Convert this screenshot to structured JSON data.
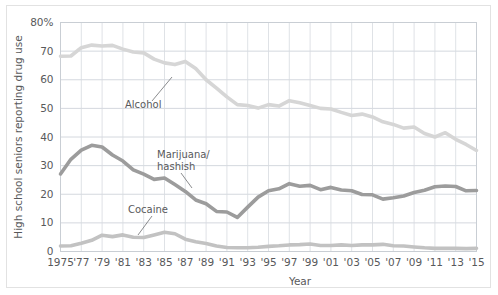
{
  "chart_data": {
    "type": "line",
    "title": "",
    "xlabel": "Year",
    "ylabel": "High school seniors reporting drug use",
    "ylim": [
      0,
      80
    ],
    "yticks": [
      0,
      10,
      20,
      30,
      40,
      50,
      60,
      70,
      80
    ],
    "ytick_labels": [
      "0",
      "10",
      "20",
      "30",
      "40",
      "50",
      "60",
      "70",
      "80%"
    ],
    "xlim": [
      1975,
      2015
    ],
    "xticks": [
      1975,
      1977,
      1979,
      1981,
      1983,
      1985,
      1987,
      1989,
      1991,
      1993,
      1995,
      1997,
      1999,
      2001,
      2003,
      2005,
      2007,
      2009,
      2011,
      2013,
      2015
    ],
    "xtick_labels": [
      "1975",
      "'77",
      "'79",
      "'81",
      "'83",
      "'85",
      "'87",
      "'89",
      "'91",
      "'93",
      "'95",
      "'97",
      "'99",
      "'01",
      "'03",
      "'05",
      "'07",
      "'09",
      "'11",
      "'13",
      "'15"
    ],
    "grid": true,
    "legend": "inline-annotations",
    "x": [
      1975,
      1976,
      1977,
      1978,
      1979,
      1980,
      1981,
      1982,
      1983,
      1984,
      1985,
      1986,
      1987,
      1988,
      1989,
      1990,
      1991,
      1992,
      1993,
      1994,
      1995,
      1996,
      1997,
      1998,
      1999,
      2000,
      2001,
      2002,
      2003,
      2004,
      2005,
      2006,
      2007,
      2008,
      2009,
      2010,
      2011,
      2012,
      2013,
      2014,
      2015
    ],
    "series": [
      {
        "name": "Alcohol",
        "color": "#d6d6d6",
        "values": [
          68.2,
          68.3,
          71.2,
          72.1,
          71.8,
          72.0,
          70.7,
          69.7,
          69.4,
          67.2,
          65.9,
          65.3,
          66.4,
          63.9,
          60.0,
          57.1,
          54.0,
          51.3,
          51.0,
          50.1,
          51.3,
          50.8,
          52.7,
          52.0,
          51.0,
          50.0,
          49.8,
          48.6,
          47.5,
          48.0,
          47.0,
          45.3,
          44.4,
          43.1,
          43.5,
          41.2,
          40.0,
          41.5,
          39.2,
          37.4,
          35.3
        ]
      },
      {
        "name": "Marijuana/hashish",
        "color": "#9c9c9c",
        "values": [
          27.1,
          32.2,
          35.4,
          37.1,
          36.5,
          33.7,
          31.6,
          28.5,
          27.0,
          25.2,
          25.7,
          23.4,
          21.0,
          18.0,
          16.7,
          14.0,
          13.8,
          11.9,
          15.5,
          19.0,
          21.2,
          21.9,
          23.7,
          22.8,
          23.1,
          21.6,
          22.4,
          21.5,
          21.2,
          19.9,
          19.8,
          18.3,
          18.8,
          19.4,
          20.6,
          21.4,
          22.6,
          22.9,
          22.7,
          21.2,
          21.3
        ]
      },
      {
        "name": "Cocaine",
        "color": "#c2c2c2",
        "values": [
          1.9,
          2.0,
          2.9,
          3.9,
          5.7,
          5.2,
          5.8,
          5.0,
          4.9,
          5.8,
          6.7,
          6.2,
          4.3,
          3.4,
          2.8,
          1.9,
          1.4,
          1.3,
          1.3,
          1.5,
          1.8,
          2.0,
          2.3,
          2.4,
          2.6,
          2.1,
          2.1,
          2.3,
          2.1,
          2.3,
          2.3,
          2.5,
          2.0,
          1.9,
          1.6,
          1.3,
          1.1,
          1.1,
          1.1,
          1.0,
          1.1
        ]
      }
    ],
    "annotations": [
      {
        "text": "Alcohol",
        "label_x": 125,
        "label_y": 108
      },
      {
        "text": "Marijuana/",
        "label_x": 157,
        "label_y": 158
      },
      {
        "text": "hashish",
        "label_x": 157,
        "label_y": 170
      },
      {
        "text": "Cocaine",
        "label_x": 128,
        "label_y": 213
      }
    ]
  },
  "axes": {
    "y_axis_title": "High school seniors reporting drug use",
    "x_axis_title": "Year"
  }
}
